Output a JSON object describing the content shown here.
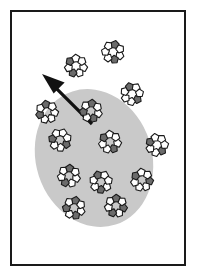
{
  "figure": {
    "panel": {
      "width": 198,
      "height": 278,
      "background": "#ffffff"
    },
    "frame": {
      "name": "figure-border",
      "x": 11,
      "y": 11,
      "width": 174,
      "height": 254,
      "stroke": "#1a1a1a",
      "stroke_width": 2,
      "fill": "#ffffff"
    },
    "region": {
      "name": "gray-ellipse-region",
      "shape": "ellipse",
      "cx": 94,
      "cy": 158,
      "rx": 58,
      "ry": 70,
      "rotation_deg": -18,
      "fill": "#c9c9c9",
      "stroke": "none"
    },
    "arrow": {
      "name": "escape-arrow",
      "tail_x": 92,
      "tail_y": 124,
      "head_x": 42,
      "head_y": 74,
      "shaft_width": 3.2,
      "head_length": 22,
      "head_half_width": 10,
      "color": "#111111",
      "direction": "up-left"
    },
    "cluster_style": {
      "node_shape": "pentagon",
      "node_radius": 4.2,
      "node_stroke": "#1a1a1a",
      "node_stroke_width": 1.1,
      "fill_light": "#ffffff",
      "fill_dark": "#6b6b6b",
      "ring_radius": 7.6,
      "nodes_per_cluster": 7
    },
    "clusters": [
      {
        "name": "cluster-outside-upper-left",
        "cx": 76,
        "cy": 66,
        "rotation_deg": 12,
        "inside_region": false,
        "dark_indices": [
          2,
          4
        ]
      },
      {
        "name": "cluster-outside-top",
        "cx": 113,
        "cy": 52,
        "rotation_deg": 28,
        "inside_region": false,
        "dark_indices": [
          1,
          5
        ]
      },
      {
        "name": "cluster-outside-right",
        "cx": 132,
        "cy": 94,
        "rotation_deg": 45,
        "inside_region": false,
        "dark_indices": [
          0,
          4
        ]
      },
      {
        "name": "cluster-edge-left",
        "cx": 47,
        "cy": 112,
        "rotation_deg": 5,
        "inside_region": false,
        "dark_indices": [
          3,
          5
        ]
      },
      {
        "name": "cluster-upper-inner",
        "cx": 91,
        "cy": 111,
        "rotation_deg": 20,
        "inside_region": true,
        "dark_indices": [
          1,
          3,
          5
        ]
      },
      {
        "name": "cluster-mid-left",
        "cx": 60,
        "cy": 140,
        "rotation_deg": 35,
        "inside_region": true,
        "dark_indices": [
          0,
          3
        ]
      },
      {
        "name": "cluster-center",
        "cx": 110,
        "cy": 142,
        "rotation_deg": 10,
        "inside_region": true,
        "dark_indices": [
          1,
          4
        ]
      },
      {
        "name": "cluster-edge-right",
        "cx": 157,
        "cy": 145,
        "rotation_deg": 50,
        "inside_region": false,
        "dark_indices": [
          0,
          3
        ]
      },
      {
        "name": "cluster-lower-left",
        "cx": 69,
        "cy": 176,
        "rotation_deg": 18,
        "inside_region": true,
        "dark_indices": [
          2,
          5
        ]
      },
      {
        "name": "cluster-lower-center",
        "cx": 101,
        "cy": 182,
        "rotation_deg": 40,
        "inside_region": true,
        "dark_indices": [
          1,
          4
        ]
      },
      {
        "name": "cluster-lower-right",
        "cx": 142,
        "cy": 180,
        "rotation_deg": 8,
        "inside_region": true,
        "dark_indices": [
          0,
          4
        ]
      },
      {
        "name": "cluster-bottom-left",
        "cx": 74,
        "cy": 208,
        "rotation_deg": 25,
        "inside_region": true,
        "dark_indices": [
          1,
          3,
          5
        ]
      },
      {
        "name": "cluster-bottom-right",
        "cx": 116,
        "cy": 206,
        "rotation_deg": 15,
        "inside_region": true,
        "dark_indices": [
          0,
          2,
          5
        ]
      }
    ]
  }
}
